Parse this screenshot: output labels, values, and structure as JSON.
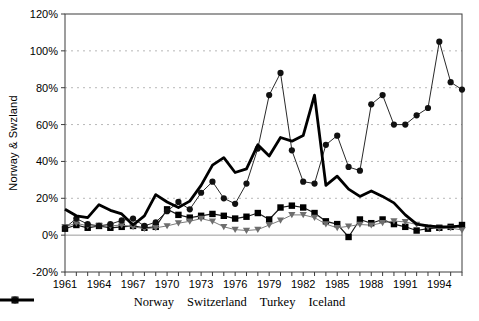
{
  "chart_data": {
    "type": "line",
    "title": "",
    "ylabel": "Norway & Swzland",
    "xlabel": "",
    "x": [
      1961,
      1962,
      1963,
      1964,
      1965,
      1966,
      1967,
      1968,
      1969,
      1970,
      1971,
      1972,
      1973,
      1974,
      1975,
      1976,
      1977,
      1978,
      1979,
      1980,
      1981,
      1982,
      1983,
      1984,
      1985,
      1986,
      1987,
      1988,
      1989,
      1990,
      1991,
      1992,
      1993,
      1994,
      1995,
      1996
    ],
    "x_tick_labels": [
      "1961",
      "1964",
      "1967",
      "1970",
      "1973",
      "1976",
      "1979",
      "1982",
      "1985",
      "1988",
      "1991",
      "1994"
    ],
    "x_tick_years": [
      1961,
      1964,
      1967,
      1970,
      1973,
      1976,
      1979,
      1982,
      1985,
      1988,
      1991,
      1994
    ],
    "y_ticks": [
      {
        "value": 120,
        "label": "120%"
      },
      {
        "value": 100,
        "label": "100%"
      },
      {
        "value": 80,
        "label": "80%"
      },
      {
        "value": 60,
        "label": "60%"
      },
      {
        "value": 40,
        "label": "40%"
      },
      {
        "value": 20,
        "label": "20%"
      },
      {
        "value": 0,
        "label": "0%"
      },
      {
        "value": -20,
        "label": "-20%"
      }
    ],
    "ylim": [
      -20,
      120
    ],
    "grid": "horizontal-dashed",
    "legend_position": "bottom-center",
    "series": [
      {
        "name": "Norway",
        "marker": "square",
        "color": "#000000",
        "line_color": "#1a1a1a",
        "line_width": 1.2,
        "values": [
          3.5,
          5.5,
          4,
          5,
          4,
          4.5,
          5,
          4,
          4.5,
          14,
          11,
          9.5,
          10.5,
          11.5,
          10.5,
          9,
          10,
          12,
          8.5,
          15,
          16,
          15,
          12,
          7.5,
          6,
          -1,
          8.5,
          6.5,
          8.5,
          6,
          4.5,
          2.5,
          3.5,
          4,
          4.5,
          5.5
        ]
      },
      {
        "name": "Switzerland",
        "marker": "triangle-down",
        "color": "#6e6e6e",
        "line_color": "#7d7d7d",
        "line_width": 1,
        "values": [
          4.5,
          6.5,
          5,
          5,
          5,
          5.5,
          4.5,
          3.5,
          4,
          5,
          6.5,
          7.5,
          9,
          7.5,
          4.5,
          3,
          2.5,
          3,
          5.5,
          8,
          11,
          11,
          9.5,
          6,
          4,
          4.8,
          5.8,
          5.4,
          6.7,
          7.6,
          7.2,
          5.8,
          4.3,
          3.6,
          3.9,
          2.8
        ]
      },
      {
        "name": "Turkey",
        "marker": "circle",
        "color": "#111111",
        "line_color": "#2a2a2a",
        "line_width": 1,
        "values": [
          4,
          9,
          6,
          5,
          6,
          8,
          9,
          5,
          7,
          13,
          18,
          14,
          23,
          29,
          20,
          17,
          28,
          47,
          76,
          88,
          46,
          29,
          28,
          49,
          54,
          37,
          35,
          71,
          76,
          60,
          60,
          65,
          69,
          105,
          83,
          79
        ]
      },
      {
        "name": "Iceland",
        "marker": "none",
        "color": "#000000",
        "line_color": "#000000",
        "line_width": 2.8,
        "values": [
          14,
          10.5,
          9.5,
          16.5,
          13.5,
          11.5,
          5.5,
          10.5,
          22,
          18,
          15,
          18.5,
          27,
          38,
          42,
          34,
          36,
          49,
          43,
          53,
          51,
          54,
          76,
          27,
          32,
          25,
          21,
          24,
          21,
          17.5,
          11,
          6,
          5,
          4.5,
          4.5,
          5
        ]
      }
    ],
    "colors": {
      "grid": "#b8b8b8",
      "zero_line": "#9a9a9a",
      "plot_border": "#3c3c3c",
      "text": "#000000"
    }
  }
}
